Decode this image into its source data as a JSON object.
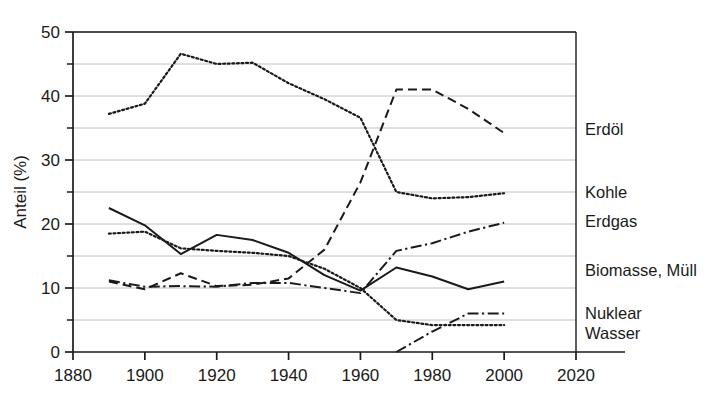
{
  "chart_data": {
    "type": "line",
    "title": "",
    "xlabel": "",
    "ylabel": "Anteil (%)",
    "xlim": [
      1880,
      2020
    ],
    "ylim": [
      0,
      50
    ],
    "xticks": [
      1880,
      1900,
      1920,
      1940,
      1960,
      1980,
      2000,
      2020
    ],
    "xtick_labels": [
      "1880",
      "1900",
      "1920",
      "1940",
      "1960",
      "1980",
      "2000",
      "2020"
    ],
    "yticks": [
      0,
      10,
      20,
      30,
      40,
      50
    ],
    "ytick_labels": [
      "0",
      "10",
      "20",
      "30",
      "40",
      "50"
    ],
    "y_minor_ticks": [
      5,
      15,
      25,
      35,
      45
    ],
    "grid": "horizontal",
    "legend_position": "right-inline-at-line-end",
    "series": [
      {
        "name": "Erdöl",
        "style": "dashed",
        "x": [
          1890,
          1900,
          1910,
          1920,
          1930,
          1940,
          1950,
          1960,
          1970,
          1980,
          1990,
          2000
        ],
        "values": [
          11.0,
          9.8,
          12.3,
          10.3,
          10.5,
          11.5,
          16.0,
          26.5,
          41.0,
          41.0,
          38.0,
          34.2
        ]
      },
      {
        "name": "Kohle",
        "style": "dotted",
        "x": [
          1890,
          1900,
          1910,
          1920,
          1930,
          1940,
          1950,
          1960,
          1970,
          1980,
          1990,
          2000
        ],
        "values": [
          37.2,
          38.8,
          46.6,
          45.0,
          45.2,
          42.0,
          39.5,
          36.6,
          25.0,
          24.0,
          24.2,
          24.8
        ]
      },
      {
        "name": "Erdgas",
        "style": "dash-dot",
        "x": [
          1890,
          1900,
          1910,
          1920,
          1930,
          1940,
          1950,
          1960,
          1970,
          1980,
          1990,
          2000
        ],
        "values": [
          11.2,
          10.2,
          10.3,
          10.2,
          10.8,
          10.8,
          10.0,
          9.2,
          15.8,
          17.0,
          18.8,
          20.2
        ]
      },
      {
        "name": "Biomasse, Müll",
        "style": "solid",
        "x": [
          1890,
          1900,
          1910,
          1920,
          1930,
          1940,
          1950,
          1960,
          1970,
          1980,
          1990,
          2000
        ],
        "values": [
          22.5,
          19.8,
          15.3,
          18.3,
          17.5,
          15.5,
          12.0,
          9.6,
          13.2,
          11.8,
          9.8,
          11.0
        ]
      },
      {
        "name": "Nuklear",
        "style": "dash-dot",
        "x": [
          1970,
          1980,
          1990,
          2000
        ],
        "values": [
          0.0,
          3.2,
          6.0,
          6.0
        ]
      },
      {
        "name": "Wasser",
        "style": "dotted",
        "x": [
          1890,
          1900,
          1910,
          1920,
          1930,
          1940,
          1950,
          1960,
          1970,
          1980,
          1990,
          2000
        ],
        "values": [
          18.5,
          18.8,
          16.2,
          15.8,
          15.5,
          15.0,
          13.0,
          10.0,
          5.0,
          4.2,
          4.2,
          4.2
        ]
      }
    ],
    "labels": [
      {
        "text": "Erdöl",
        "series": "Erdöl"
      },
      {
        "text": "Kohle",
        "series": "Kohle"
      },
      {
        "text": "Erdgas",
        "series": "Erdgas"
      },
      {
        "text": "Biomasse, Müll",
        "series": "Biomasse, Müll"
      },
      {
        "text": "Nuklear",
        "series": "Nuklear"
      },
      {
        "text": "Wasser",
        "series": "Wasser"
      }
    ],
    "colors": {
      "line": "#1a1a1a",
      "grid": "#b9b9b9",
      "axis": "#1a1a1a",
      "text": "#1a1a1a",
      "background": "#ffffff"
    }
  }
}
